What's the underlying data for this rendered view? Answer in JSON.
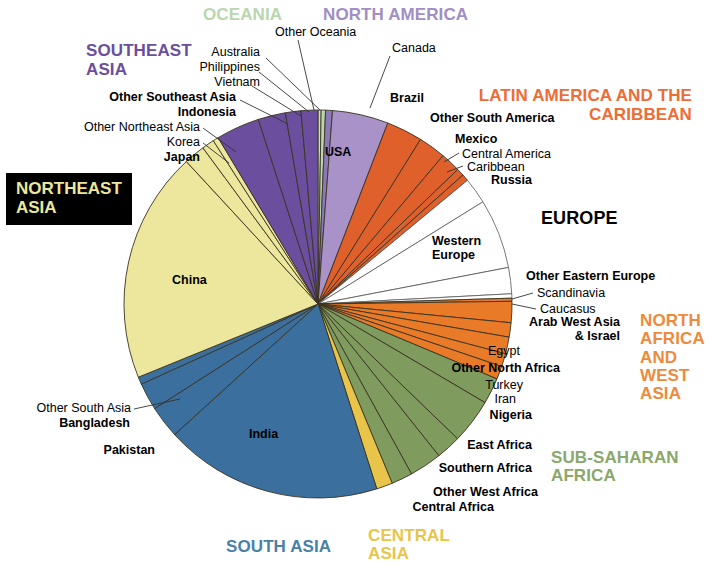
{
  "chart_data": {
    "type": "pie",
    "xlabel": "",
    "ylabel": "",
    "legend_position": "labels-around-pie",
    "grid": false,
    "start_angle_deg": -90,
    "direction": "clockwise",
    "regions": [
      {
        "name": "OCEANIA",
        "color": "#b9d6af",
        "label_color": "#b9d6af"
      },
      {
        "name": "NORTH AMERICA",
        "color": "#a18ec4",
        "label_color": "#a18ec4"
      },
      {
        "name": "LATIN AMERICA AND THE CARIBBEAN",
        "color": "#e0602c",
        "label_color": "#ef6c35"
      },
      {
        "name": "EUROPE",
        "color": "#ffffff",
        "label_color": "#000000"
      },
      {
        "name": "NORTH AFRICA AND WEST ASIA",
        "color": "#e87a28",
        "label_color": "#ef8a3c"
      },
      {
        "name": "SUB-SAHARAN AFRICA",
        "color": "#7f9c5e",
        "label_color": "#8aa86a"
      },
      {
        "name": "CENTRAL ASIA",
        "color": "#e8c54a",
        "label_color": "#e8c54a"
      },
      {
        "name": "SOUTH ASIA",
        "color": "#3b6f9e",
        "label_color": "#4a7fa8"
      },
      {
        "name": "NORTHEAST ASIA",
        "color": "#ece79c",
        "label_color": "#ece79c"
      },
      {
        "name": "SOUTHEAST ASIA",
        "color": "#6b4e9e",
        "label_color": "#6b4e9e"
      }
    ],
    "slices": [
      {
        "label": "Other Oceania",
        "region": "OCEANIA",
        "color": "#cfe3c6",
        "value": 0.25
      },
      {
        "label": "Australia",
        "region": "OCEANIA",
        "color": "#b9d6af",
        "value": 0.35
      },
      {
        "label": "Canada",
        "region": "NORTH AMERICA",
        "color": "#8d79b8",
        "value": 0.55
      },
      {
        "label": "USA",
        "region": "NORTH AMERICA",
        "color": "#a992c8",
        "value": 4.5
      },
      {
        "label": "Brazil",
        "region": "LATIN AMERICA AND THE CARIBBEAN",
        "color": "#e0602c",
        "value": 2.9
      },
      {
        "label": "Other South America",
        "region": "LATIN AMERICA AND THE CARIBBEAN",
        "color": "#e0602c",
        "value": 2.2
      },
      {
        "label": "Mexico",
        "region": "LATIN AMERICA AND THE CARIBBEAN",
        "color": "#e0602c",
        "value": 1.6
      },
      {
        "label": "Central America",
        "region": "LATIN AMERICA AND THE CARIBBEAN",
        "color": "#e0602c",
        "value": 0.6
      },
      {
        "label": "Caribbean",
        "region": "LATIN AMERICA AND THE CARIBBEAN",
        "color": "#e0602c",
        "value": 0.55
      },
      {
        "label": "Russia",
        "region": "EUROPE",
        "color": "#ffffff",
        "value": 2.1
      },
      {
        "label": "Western Europe",
        "region": "EUROPE",
        "color": "#ffffff",
        "value": 5.6
      },
      {
        "label": "Other Eastern Europe",
        "region": "EUROPE",
        "color": "#ffffff",
        "value": 2.1
      },
      {
        "label": "Scandinavia",
        "region": "EUROPE",
        "color": "#ffffff",
        "value": 0.35
      },
      {
        "label": "Caucasus",
        "region": "NORTH AFRICA AND WEST ASIA",
        "color": "#e87a28",
        "value": 0.25
      },
      {
        "label": "Arab West Asia & Israel",
        "region": "NORTH AFRICA AND WEST ASIA",
        "color": "#e87a28",
        "value": 1.7
      },
      {
        "label": "Egypt",
        "region": "NORTH AFRICA AND WEST ASIA",
        "color": "#e87a28",
        "value": 1.15
      },
      {
        "label": "Other North Africa",
        "region": "NORTH AFRICA AND WEST ASIA",
        "color": "#e87a28",
        "value": 1.35
      },
      {
        "label": "Turkey",
        "region": "NORTH AFRICA AND WEST ASIA",
        "color": "#e87a28",
        "value": 1.05
      },
      {
        "label": "Iran",
        "region": "NORTH AFRICA AND WEST ASIA",
        "color": "#e87a28",
        "value": 1.05
      },
      {
        "label": "Nigeria",
        "region": "SUB-SAHARAN AFRICA",
        "color": "#7f9c5e",
        "value": 2.1
      },
      {
        "label": "East Africa",
        "region": "SUB-SAHARAN AFRICA",
        "color": "#7f9c5e",
        "value": 3.6
      },
      {
        "label": "Southern Africa",
        "region": "SUB-SAHARAN AFRICA",
        "color": "#7f9c5e",
        "value": 2.0
      },
      {
        "label": "Other West Africa",
        "region": "SUB-SAHARAN AFRICA",
        "color": "#7f9c5e",
        "value": 2.6
      },
      {
        "label": "Central Africa",
        "region": "SUB-SAHARAN AFRICA",
        "color": "#7f9c5e",
        "value": 1.7
      },
      {
        "label": "Central Asia",
        "region": "CENTRAL ASIA",
        "color": "#e8c54a",
        "value": 1.3
      },
      {
        "label": "India",
        "region": "SOUTH ASIA",
        "color": "#3b6f9e",
        "value": 17.5
      },
      {
        "label": "Pakistan",
        "region": "SOUTH ASIA",
        "color": "#3b6f9e",
        "value": 2.6
      },
      {
        "label": "Bangladesh",
        "region": "SOUTH ASIA",
        "color": "#3b6f9e",
        "value": 2.2
      },
      {
        "label": "Other South Asia",
        "region": "SOUTH ASIA",
        "color": "#3b6f9e",
        "value": 0.6
      },
      {
        "label": "China",
        "region": "NORTHEAST ASIA",
        "color": "#ece79c",
        "value": 18.6
      },
      {
        "label": "Japan",
        "region": "NORTHEAST ASIA",
        "color": "#ece79c",
        "value": 1.7
      },
      {
        "label": "Korea",
        "region": "NORTHEAST ASIA",
        "color": "#ece79c",
        "value": 1.0
      },
      {
        "label": "Other Northeast Asia",
        "region": "NORTHEAST ASIA",
        "color": "#ece79c",
        "value": 0.45
      },
      {
        "label": "Indonesia",
        "region": "SOUTHEAST ASIA",
        "color": "#6b4e9e",
        "value": 3.5
      },
      {
        "label": "Other Southeast Asia",
        "region": "SOUTHEAST ASIA",
        "color": "#6b4e9e",
        "value": 2.2
      },
      {
        "label": "Vietnam",
        "region": "SOUTHEAST ASIA",
        "color": "#6b4e9e",
        "value": 1.25
      },
      {
        "label": "Philippines",
        "region": "SOUTHEAST ASIA",
        "color": "#6b4e9e",
        "value": 1.35
      },
      {
        "label": "Australia-leader",
        "region": "OCEANIA",
        "color": "#b9d6af",
        "value": 0.0
      }
    ]
  },
  "regions": {
    "oceania": "OCEANIA",
    "north_america": "NORTH AMERICA",
    "southeast_asia_l1": "SOUTHEAST",
    "southeast_asia_l2": "ASIA",
    "latam_l1": "LATIN AMERICA AND THE",
    "latam_l2": "CARIBBEAN",
    "europe": "EUROPE",
    "nawa_l1": "NORTH",
    "nawa_l2": "AFRICA",
    "nawa_l3": "AND",
    "nawa_l4": "WEST",
    "nawa_l5": "ASIA",
    "ssa_l1": "SUB-SAHARAN",
    "ssa_l2": "AFRICA",
    "central_asia_l1": "CENTRAL",
    "central_asia_l2": "ASIA",
    "south_asia": "SOUTH ASIA",
    "northeast_asia_l1": "NORTHEAST",
    "northeast_asia_l2": "ASIA"
  },
  "slice_labels": {
    "other_oceania": "Other Oceania",
    "australia": "Australia",
    "philippines": "Philippines",
    "vietnam": "Vietnam",
    "other_southeast_asia": "Other Southeast Asia",
    "indonesia": "Indonesia",
    "other_northeast_asia": "Other Northeast Asia",
    "korea": "Korea",
    "japan": "Japan",
    "china": "China",
    "canada": "Canada",
    "usa": "USA",
    "brazil": "Brazil",
    "other_south_america": "Other South America",
    "mexico": "Mexico",
    "central_america": "Central America",
    "caribbean": "Caribbean",
    "russia": "Russia",
    "western_europe_l1": "Western",
    "western_europe_l2": "Europe",
    "other_eastern_europe": "Other Eastern Europe",
    "scandinavia": "Scandinavia",
    "caucasus": "Caucasus",
    "arab_west_asia_l1": "Arab West Asia",
    "arab_west_asia_l2": "& Israel",
    "egypt": "Egypt",
    "other_north_africa": "Other North Africa",
    "turkey": "Turkey",
    "iran": "Iran",
    "nigeria": "Nigeria",
    "east_africa": "East Africa",
    "southern_africa": "Southern Africa",
    "other_west_africa": "Other West Africa",
    "central_africa": "Central Africa",
    "india": "India",
    "pakistan": "Pakistan",
    "bangladesh": "Bangladesh",
    "other_south_asia": "Other South Asia"
  }
}
